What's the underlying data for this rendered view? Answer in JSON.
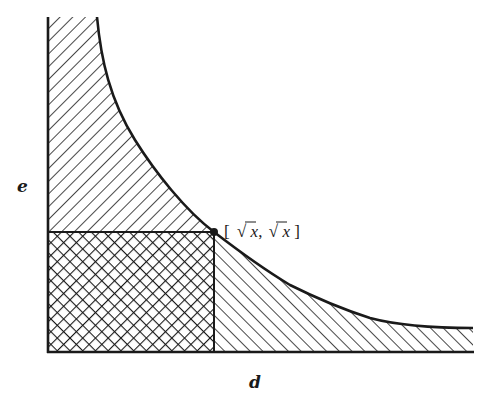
{
  "diagram": {
    "y_axis_label": "e",
    "x_axis_label": "d",
    "point_label": "[ √x, √x ]",
    "point_label_parts": {
      "open": "[",
      "first_radical": "√",
      "first_var": "x",
      "comma": ",",
      "second_radical": "√",
      "second_var": "x",
      "close": "]"
    },
    "regions": [
      {
        "name": "upper-left-region",
        "hatch": "forward-diagonal"
      },
      {
        "name": "square-region",
        "hatch": "cross-hatch"
      },
      {
        "name": "lower-right-region",
        "hatch": "back-diagonal"
      }
    ],
    "colors": {
      "ink": "#1a1a1a",
      "background": "#ffffff"
    }
  }
}
